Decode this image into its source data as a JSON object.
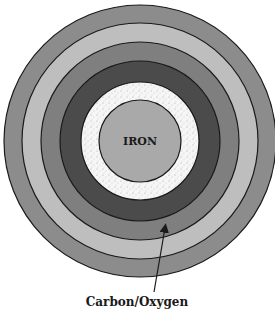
{
  "diagram": {
    "center": {
      "x": 140,
      "y": 141
    },
    "layers": [
      {
        "name": "outer-shell",
        "radius": 136,
        "fill": "#8c8c8c",
        "pattern": "none",
        "label": ""
      },
      {
        "name": "shell-2",
        "radius": 118,
        "fill": "#bebebe",
        "pattern": "none",
        "label": ""
      },
      {
        "name": "shell-3",
        "radius": 99,
        "fill": "#7f7f7f",
        "pattern": "none",
        "label": ""
      },
      {
        "name": "carbon-oxygen-shell",
        "radius": 80,
        "fill": "#4b4b4b",
        "pattern": "none",
        "label": "Carbon/Oxygen"
      },
      {
        "name": "stippled-shell",
        "radius": 59,
        "fill": "#f4f4f4",
        "pattern": "stipple",
        "label": ""
      },
      {
        "name": "iron-core",
        "radius": 41,
        "fill": "#a9a9a9",
        "pattern": "none",
        "label": "IRON"
      }
    ],
    "core_label": "IRON",
    "callout": {
      "text": "Carbon/Oxygen",
      "arrow_from": {
        "x": 154,
        "y": 292
      },
      "arrow_to": {
        "x": 165,
        "y": 228
      }
    },
    "stroke_color": "#1a1a1a"
  }
}
